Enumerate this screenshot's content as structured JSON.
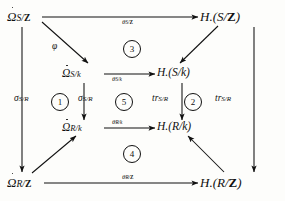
{
  "diagram": {
    "type": "commutative-diagram",
    "nodes": [
      {
        "id": "omega-s-z",
        "label_base": "Ω",
        "accent": "dot",
        "subscript": "S/",
        "subscript_bold": "Z",
        "full": "Ω̇_{S/Z}",
        "position": "top-left-outer"
      },
      {
        "id": "h-s-z",
        "label_base": "H.(S/",
        "accent": "none",
        "subscript": "",
        "subscript_bold": "Z",
        "full": "H.(S/Z)",
        "position": "top-right-outer"
      },
      {
        "id": "omega-s-k",
        "label_base": "Ω",
        "accent": "dot",
        "subscript": "S/k",
        "subscript_bold": "",
        "full": "Ω̇_{S/k}",
        "position": "top-left-inner"
      },
      {
        "id": "h-s-k",
        "label_base": "H.(S/k)",
        "accent": "none",
        "subscript": "",
        "subscript_bold": "",
        "full": "H.(S/k)",
        "position": "top-right-inner"
      },
      {
        "id": "omega-r-k",
        "label_base": "Ω",
        "accent": "dot",
        "subscript": "R/k",
        "subscript_bold": "",
        "full": "Ω̇_{R/k}",
        "position": "bottom-left-inner"
      },
      {
        "id": "h-r-k",
        "label_base": "H.(R/k)",
        "accent": "none",
        "subscript": "",
        "subscript_bold": "",
        "full": "H.(R/k)",
        "position": "bottom-right-inner"
      },
      {
        "id": "omega-r-z",
        "label_base": "Ω",
        "accent": "dot",
        "subscript": "R/",
        "subscript_bold": "Z",
        "full": "Ω̇_{R/Z}",
        "position": "bottom-left-outer"
      },
      {
        "id": "h-r-z",
        "label_base": "H.(R/",
        "accent": "none",
        "subscript": "",
        "subscript_bold": "Z",
        "full": "H.(R/Z)",
        "position": "bottom-right-outer"
      }
    ],
    "node_text": {
      "omega_s_z_main": "Ω",
      "omega_s_z_sub_a": "S/",
      "omega_s_z_sub_b": "Z",
      "h_s_z_main": "H.(S/",
      "h_s_z_bold": "Z",
      "h_s_z_tail": ")",
      "omega_s_k_main": "Ω",
      "omega_s_k_sub": "S/k",
      "h_s_k": "H.(S/k)",
      "omega_r_k_main": "Ω",
      "omega_r_k_sub": "R/k",
      "h_r_k": "H.(R/k)",
      "omega_r_z_main": "Ω",
      "omega_r_z_sub_a": "R/",
      "omega_r_z_sub_b": "Z",
      "h_r_z_main": "H.(R/",
      "h_r_z_bold": "Z",
      "h_r_z_tail": ")"
    },
    "arrow_labels": {
      "theta_s_z_main": "θ",
      "theta_s_z_sub_a": "S/",
      "theta_s_z_sub_b": "Z",
      "theta_s_k_main": "θ",
      "theta_s_k_sub": "S/k",
      "theta_r_k_main": "θ",
      "theta_r_k_sub": "R/k",
      "theta_r_z_main": "θ",
      "theta_r_z_sub_a": "R/",
      "theta_r_z_sub_b": "Z",
      "phi": "φ",
      "sigma_outer_main": "σ",
      "sigma_outer_sub": "S/R",
      "sigma_inner_main": "σ",
      "sigma_inner_sub": "S/R",
      "tr_inner_main": "tr",
      "tr_inner_sub": "S/R",
      "tr_outer_main": "tr",
      "tr_outer_sub": "S/R"
    },
    "region_numbers": [
      {
        "id": "region-1",
        "label": "1",
        "placement": "left-face"
      },
      {
        "id": "region-2",
        "label": "2",
        "placement": "right-face"
      },
      {
        "id": "region-3",
        "label": "3",
        "placement": "top-face"
      },
      {
        "id": "region-4",
        "label": "4",
        "placement": "bottom-face"
      },
      {
        "id": "region-5",
        "label": "5",
        "placement": "inner-left"
      }
    ],
    "colors": {
      "ink": "#111111",
      "background": "#fdfdfb"
    }
  }
}
